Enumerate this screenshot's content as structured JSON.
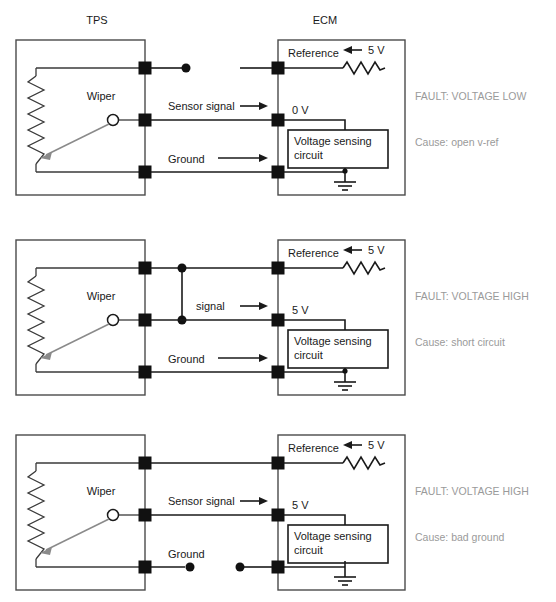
{
  "page": {
    "background_color": "#ffffff",
    "fault_text_color": "#9a9a9a",
    "line_color": "#1a1a1a",
    "wiper_color": "#8a8a8a"
  },
  "headers": {
    "tps": "TPS",
    "ecm": "ECM"
  },
  "common": {
    "wiper_label": "Wiper",
    "reference_label": "Reference",
    "supply_label": "5 V",
    "ground_label": "Ground",
    "voltage_sensing_line1": "Voltage sensing",
    "voltage_sensing_line2": "circuit",
    "fault_prefix": "FAULT: ",
    "cause_prefix": "Cause: "
  },
  "diagrams": [
    {
      "id": "diagram-open-vref",
      "index": 1,
      "show_headers": true,
      "signal_label": "Sensor signal",
      "ground_label": "Ground",
      "reference_label": "Reference",
      "supply_label": "5 V",
      "signal_voltage": "0 V",
      "reference_broken": true,
      "signal_broken": false,
      "ground_broken": false,
      "short_circuit": false,
      "fault": "FAULT: VOLTAGE LOW",
      "cause": "Cause: open v-ref",
      "fault_value": "VOLTAGE LOW",
      "cause_value": "open v-ref"
    },
    {
      "id": "diagram-short-circuit",
      "index": 2,
      "show_headers": false,
      "signal_label": "signal",
      "ground_label": "Ground",
      "reference_label": "Reference",
      "supply_label": "5 V",
      "signal_voltage": "5 V",
      "reference_broken": false,
      "signal_broken": false,
      "ground_broken": false,
      "short_circuit": true,
      "fault": "FAULT: VOLTAGE HIGH",
      "cause": "Cause: short circuit",
      "fault_value": "VOLTAGE HIGH",
      "cause_value": "short circuit"
    },
    {
      "id": "diagram-bad-ground",
      "index": 3,
      "show_headers": false,
      "signal_label": "Sensor signal",
      "ground_label": "Ground",
      "reference_label": "Reference",
      "supply_label": "5 V",
      "signal_voltage": "5 V",
      "reference_broken": false,
      "signal_broken": false,
      "ground_broken": true,
      "short_circuit": false,
      "fault": "FAULT: VOLTAGE HIGH",
      "cause": "Cause: bad ground",
      "fault_value": "VOLTAGE HIGH",
      "cause_value": "bad ground"
    }
  ]
}
